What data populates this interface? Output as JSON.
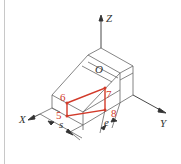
{
  "figure": {
    "axes": {
      "x_label": "X",
      "y_label": "Y",
      "z_label": "Z",
      "origin_label": "O"
    },
    "points": [
      {
        "id": "5",
        "label": "5"
      },
      {
        "id": "6",
        "label": "6"
      },
      {
        "id": "7",
        "label": "7"
      },
      {
        "id": "8",
        "label": "8"
      }
    ],
    "dimensions": {
      "s_label": "s",
      "e_label": "e"
    },
    "colors": {
      "line": "#555555",
      "highlight": "#d23a2a",
      "axis": "#333333"
    }
  }
}
